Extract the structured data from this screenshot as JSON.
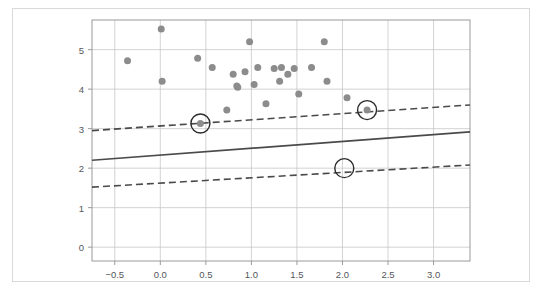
{
  "chart_data": {
    "type": "scatter",
    "title": "",
    "subtitle": "",
    "xlabel": "",
    "ylabel": "",
    "xlim": [
      -0.75,
      3.4
    ],
    "ylim": [
      -0.35,
      5.75
    ],
    "xticks": [
      -0.5,
      0.0,
      0.5,
      1.0,
      1.5,
      2.0,
      2.5,
      3.0
    ],
    "xtick_labels": [
      "−0.5",
      "0.0",
      "0.5",
      "1.0",
      "1.5",
      "2.0",
      "2.5",
      "3.0"
    ],
    "yticks": [
      0,
      1,
      2,
      3,
      4,
      5
    ],
    "ytick_labels": [
      "0",
      "1",
      "2",
      "3",
      "4",
      "5"
    ],
    "grid": true,
    "legend": "none",
    "point_color": "#8c8c8c",
    "line_color": "#4a4a4a",
    "grid_color": "#c8c8c8",
    "axis_color": "#9a9a9a",
    "marker_size": 7,
    "points": [
      {
        "x": -0.36,
        "y": 4.72
      },
      {
        "x": 0.01,
        "y": 5.52
      },
      {
        "x": 0.02,
        "y": 4.2
      },
      {
        "x": 0.41,
        "y": 4.78
      },
      {
        "x": 0.57,
        "y": 4.55
      },
      {
        "x": 0.73,
        "y": 3.47
      },
      {
        "x": 0.8,
        "y": 4.38
      },
      {
        "x": 0.84,
        "y": 4.08
      },
      {
        "x": 0.85,
        "y": 4.05
      },
      {
        "x": 0.93,
        "y": 4.44
      },
      {
        "x": 0.98,
        "y": 5.2
      },
      {
        "x": 1.03,
        "y": 4.12
      },
      {
        "x": 1.07,
        "y": 4.55
      },
      {
        "x": 1.16,
        "y": 3.63
      },
      {
        "x": 1.25,
        "y": 4.52
      },
      {
        "x": 1.31,
        "y": 4.2
      },
      {
        "x": 1.33,
        "y": 4.55
      },
      {
        "x": 1.4,
        "y": 4.38
      },
      {
        "x": 1.47,
        "y": 4.52
      },
      {
        "x": 1.52,
        "y": 3.88
      },
      {
        "x": 1.66,
        "y": 4.55
      },
      {
        "x": 1.8,
        "y": 5.2
      },
      {
        "x": 1.83,
        "y": 4.2
      },
      {
        "x": 2.05,
        "y": 3.78
      },
      {
        "x": 0.44,
        "y": 3.13
      },
      {
        "x": 2.27,
        "y": 3.47
      }
    ],
    "fit_line": {
      "name": "regression-line",
      "style": "solid",
      "x": [
        -0.75,
        3.4
      ],
      "y": [
        2.2,
        2.92
      ]
    },
    "interval_lines": [
      {
        "name": "upper-bound",
        "style": "dashed",
        "x": [
          -0.75,
          3.4
        ],
        "y": [
          2.95,
          3.6
        ]
      },
      {
        "name": "lower-bound",
        "style": "dashed",
        "x": [
          -0.75,
          3.4
        ],
        "y": [
          1.52,
          2.08
        ]
      }
    ],
    "highlighted": [
      {
        "x": 0.44,
        "y": 3.13,
        "has_point": true
      },
      {
        "x": 2.27,
        "y": 3.47,
        "has_point": true
      },
      {
        "x": 2.02,
        "y": 2.0,
        "has_point": false
      }
    ]
  }
}
